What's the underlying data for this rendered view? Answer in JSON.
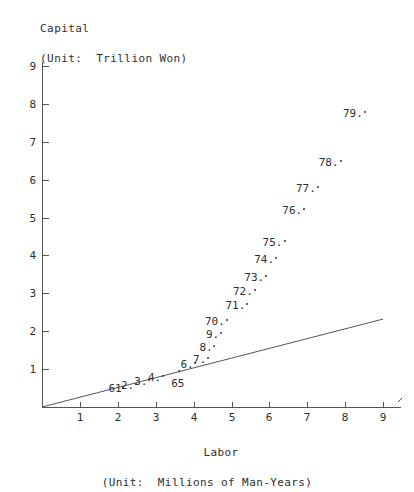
{
  "chart_data": {
    "type": "scatter",
    "title": "",
    "ylabel": "Capital",
    "ylabel_unit": "(Unit:  Trillion Won)",
    "xlabel": "Labor",
    "xlabel_unit": "(Unit:  Millions of Man-Years)",
    "xlim": [
      0,
      9.45
    ],
    "ylim": [
      0,
      9.1
    ],
    "xticks": [
      1,
      2,
      3,
      4,
      5,
      6,
      7,
      8,
      9
    ],
    "yticks": [
      1,
      2,
      3,
      4,
      5,
      6,
      7,
      8,
      9
    ],
    "xtick_labels": [
      "1",
      "2",
      "3",
      "4",
      "5",
      "6",
      "7",
      "8",
      "9"
    ],
    "ytick_labels": [
      "1",
      "2",
      "3",
      "4",
      "5",
      "6",
      "7",
      "8",
      "9"
    ],
    "grid": false,
    "legend": "none",
    "axis_color": "#555555",
    "marker_color": "#3a3a3a",
    "trend_line": {
      "type": "line",
      "x": [
        0,
        9
      ],
      "y": [
        0,
        2.32
      ],
      "color": "#555555"
    },
    "points": [
      {
        "label": "61",
        "label_text": "61",
        "x": 2.15,
        "y": 0.54,
        "label_pos": "left"
      },
      {
        "label": "62",
        "label_text": "2.",
        "x": 2.48,
        "y": 0.62,
        "label_pos": "left"
      },
      {
        "label": "63",
        "label_text": "3.",
        "x": 2.83,
        "y": 0.72,
        "label_pos": "left"
      },
      {
        "label": "64",
        "label_text": "4.",
        "x": 3.19,
        "y": 0.82,
        "label_pos": "left"
      },
      {
        "label": "65",
        "label_text": "65",
        "x": 3.62,
        "y": 0.95,
        "label_pos": "below"
      },
      {
        "label": "66",
        "label_text": "6.",
        "x": 4.05,
        "y": 1.15,
        "label_pos": "left"
      },
      {
        "label": "67",
        "label_text": "7.",
        "x": 4.38,
        "y": 1.28,
        "label_pos": "left"
      },
      {
        "label": "68",
        "label_text": "8.",
        "x": 4.55,
        "y": 1.62,
        "label_pos": "left"
      },
      {
        "label": "69",
        "label_text": "9.",
        "x": 4.72,
        "y": 1.95,
        "label_pos": "left"
      },
      {
        "label": "70",
        "label_text": "70.",
        "x": 4.88,
        "y": 2.3,
        "label_pos": "left"
      },
      {
        "label": "71",
        "label_text": "71.",
        "x": 5.42,
        "y": 2.72,
        "label_pos": "left"
      },
      {
        "label": "72",
        "label_text": "72.",
        "x": 5.62,
        "y": 3.08,
        "label_pos": "left"
      },
      {
        "label": "73",
        "label_text": "73.",
        "x": 5.92,
        "y": 3.45,
        "label_pos": "left"
      },
      {
        "label": "74",
        "label_text": "74.",
        "x": 6.18,
        "y": 3.92,
        "label_pos": "left"
      },
      {
        "label": "75",
        "label_text": "75.",
        "x": 6.4,
        "y": 4.38,
        "label_pos": "left"
      },
      {
        "label": "76",
        "label_text": "76.",
        "x": 6.92,
        "y": 5.22,
        "label_pos": "left"
      },
      {
        "label": "77",
        "label_text": "77.",
        "x": 7.28,
        "y": 5.8,
        "label_pos": "left"
      },
      {
        "label": "78",
        "label_text": "78.",
        "x": 7.88,
        "y": 6.5,
        "label_pos": "left"
      },
      {
        "label": "79",
        "label_text": "79.",
        "x": 8.52,
        "y": 7.78,
        "label_pos": "left"
      }
    ]
  }
}
